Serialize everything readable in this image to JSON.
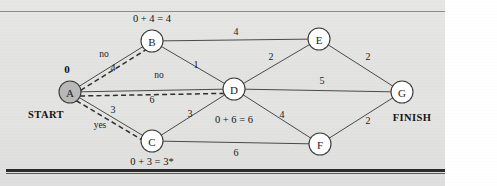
{
  "figure": {
    "start_label": "START",
    "finish_label": "FINISH",
    "start_value": "0"
  },
  "colors": {
    "paper": "#e3e3e1",
    "node_fill": "#ffffff",
    "node_fill_visited": "#b9b9b9",
    "node_stroke": "#3a3a3a",
    "edge": "#4a4a4a",
    "trace": "#2f2f2f",
    "text": "#1b1b1b",
    "rule_dark": "#2b2b2b"
  },
  "chart_data": {
    "type": "diagram",
    "nodes": [
      {
        "id": "A",
        "label": "A",
        "x": 70,
        "y": 92,
        "r": 11,
        "filled": true,
        "note": "0",
        "note_pos": "above"
      },
      {
        "id": "B",
        "label": "B",
        "x": 152,
        "y": 41,
        "r": 11,
        "filled": false,
        "note": "0 + 4 = 4",
        "note_pos": "above"
      },
      {
        "id": "C",
        "label": "C",
        "x": 152,
        "y": 141,
        "r": 11,
        "filled": false,
        "note": "0 + 3 = 3*",
        "note_pos": "below"
      },
      {
        "id": "D",
        "label": "D",
        "x": 234,
        "y": 89,
        "r": 11,
        "filled": false,
        "note": "0 + 6 = 6",
        "note_pos": "below"
      },
      {
        "id": "E",
        "label": "E",
        "x": 319,
        "y": 39,
        "r": 11,
        "filled": false,
        "note": "",
        "note_pos": "above"
      },
      {
        "id": "F",
        "label": "F",
        "x": 320,
        "y": 144,
        "r": 11,
        "filled": false,
        "note": "",
        "note_pos": "below"
      },
      {
        "id": "G",
        "label": "G",
        "x": 402,
        "y": 92,
        "r": 11,
        "filled": false,
        "note": "",
        "note_pos": "above"
      }
    ],
    "edges": [
      {
        "from": "A",
        "to": "B",
        "weight": "4",
        "lx": 113,
        "ly": 71
      },
      {
        "from": "A",
        "to": "C",
        "weight": "3",
        "lx": 113,
        "ly": 113
      },
      {
        "from": "A",
        "to": "D",
        "weight": "6",
        "lx": 152,
        "ly": 103
      },
      {
        "from": "B",
        "to": "D",
        "weight": "1",
        "lx": 196,
        "ly": 68
      },
      {
        "from": "B",
        "to": "E",
        "weight": "4",
        "lx": 236,
        "ly": 35
      },
      {
        "from": "C",
        "to": "D",
        "weight": "3",
        "lx": 190,
        "ly": 117
      },
      {
        "from": "C",
        "to": "F",
        "weight": "6",
        "lx": 236,
        "ly": 156
      },
      {
        "from": "D",
        "to": "E",
        "weight": "2",
        "lx": 271,
        "ly": 60
      },
      {
        "from": "D",
        "to": "F",
        "weight": "4",
        "lx": 282,
        "ly": 118
      },
      {
        "from": "D",
        "to": "G",
        "weight": "5",
        "lx": 322,
        "ly": 84
      },
      {
        "from": "E",
        "to": "G",
        "weight": "2",
        "lx": 368,
        "ly": 60
      },
      {
        "from": "F",
        "to": "G",
        "weight": "2",
        "lx": 368,
        "ly": 124
      }
    ],
    "traces": [
      {
        "from": "A",
        "to": "B",
        "label": "no",
        "lx": 104,
        "ly": 57
      },
      {
        "from": "A",
        "to": "D",
        "label": "no",
        "lx": 159,
        "ly": 78
      },
      {
        "from": "A",
        "to": "C",
        "label": "yes",
        "lx": 100,
        "ly": 128
      }
    ],
    "node_notes": [
      {
        "node": "B",
        "text": "0 + 4 = 4",
        "x": 152,
        "y": 22
      },
      {
        "node": "D",
        "text": "0 + 6 = 6",
        "x": 234,
        "y": 123
      },
      {
        "node": "C",
        "text": "0 + 3 = 3*",
        "x": 152,
        "y": 165
      },
      {
        "node": "A",
        "text": "0",
        "x": 67,
        "y": 73
      }
    ],
    "endpoints": [
      {
        "text": "START",
        "x": 46,
        "y": 118
      },
      {
        "text": "FINISH",
        "x": 412,
        "y": 121
      }
    ]
  }
}
